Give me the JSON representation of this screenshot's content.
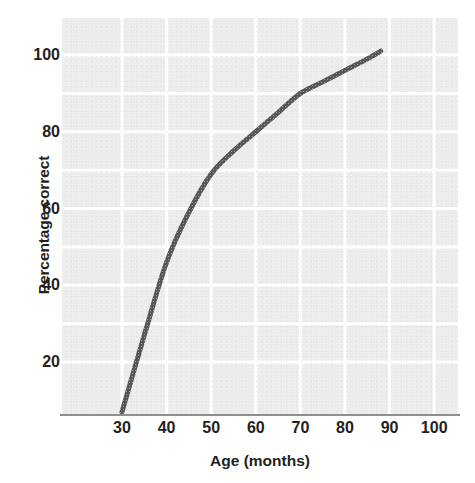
{
  "chart_data": {
    "type": "line",
    "title": "",
    "subtitle": "",
    "xlabel": "Age (months)",
    "ylabel": "Percentage correct",
    "xlim": [
      22,
      106
    ],
    "ylim": [
      0,
      104
    ],
    "grid": true,
    "legend": false,
    "legend_position": "none",
    "annotations": [],
    "x_ticks": [
      30,
      40,
      50,
      60,
      70,
      80,
      90,
      100
    ],
    "x_tick_labels": [
      "30",
      "40",
      "50",
      "60",
      "70",
      "80",
      "90",
      "100"
    ],
    "y_ticks": [
      20,
      40,
      60,
      80,
      100
    ],
    "y_tick_labels": [
      "20",
      "40",
      "60",
      "80",
      "100"
    ],
    "y_minor_gridlines": [
      30,
      50,
      70,
      90
    ],
    "x_minor_gridlines": [],
    "series": [
      {
        "name": "Percentage correct",
        "color": "#565656",
        "line_width": 5,
        "x": [
          30,
          35,
          40,
          45,
          50,
          55,
          60,
          65,
          70,
          75,
          80,
          85,
          88
        ],
        "values": [
          7,
          27,
          46,
          59,
          69,
          75,
          80,
          85,
          90,
          93,
          96,
          99,
          101
        ]
      }
    ]
  },
  "axes": {
    "y_title": "Percentage correct",
    "x_title": "Age (months)",
    "y_tick_labels": [
      "100",
      "80",
      "60",
      "40",
      "20"
    ],
    "x_tick_labels": [
      "30",
      "40",
      "50",
      "60",
      "70",
      "80",
      "90",
      "100"
    ]
  },
  "colors": {
    "panel_background": "#ececec",
    "gridline": "#ffffff",
    "curve": "#565656",
    "axis_line": "#8f8f8f",
    "text": "#231f20",
    "page_background": "#ffffff"
  }
}
